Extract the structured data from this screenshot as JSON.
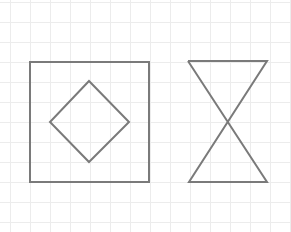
{
  "canvas": {
    "width": 291,
    "height": 232,
    "background": "#ffffff"
  },
  "grid": {
    "spacing": 20,
    "offset_x": 10,
    "offset_y": 2,
    "color": "#ececec"
  },
  "stroke": {
    "color": "#7a7a7a",
    "width": 2
  },
  "shapes": {
    "outer_square": {
      "x": 30,
      "y": 62,
      "width": 119,
      "height": 120
    },
    "inner_diamond": {
      "points": "89,81 129,122 89,162 50,122"
    },
    "hourglass": {
      "points": "188,61 267,61 189,182 267,182 188,61"
    }
  }
}
